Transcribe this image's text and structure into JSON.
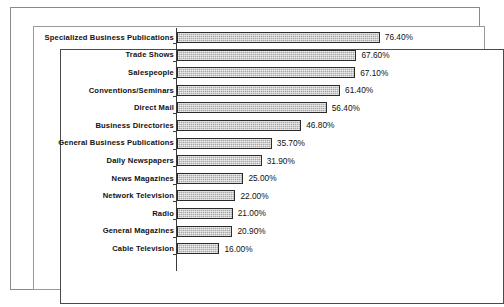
{
  "chart_data": {
    "type": "bar",
    "orientation": "horizontal",
    "title": "",
    "subtitle": "",
    "xlabel": "",
    "ylabel": "",
    "grid": false,
    "legend": false,
    "xlim": [
      0,
      80
    ],
    "value_suffix": "%",
    "categories": [
      "Specialized Business Publications",
      "Trade Shows",
      "Salespeople",
      "Conventions/Seminars",
      "Direct Mail",
      "Business Directories",
      "General Business Publications",
      "Daily Newspapers",
      "News Magazines",
      "Network Television",
      "Radio",
      "General Magazines",
      "Cable Television"
    ],
    "values": [
      76.4,
      67.6,
      67.1,
      61.4,
      56.4,
      46.8,
      35.7,
      31.9,
      25.0,
      22.0,
      21.0,
      20.9,
      16.0
    ],
    "value_labels": [
      "76.40%",
      "67.60%",
      "67.10%",
      "61.40%",
      "56.40%",
      "46.80%",
      "35.70%",
      "31.90%",
      "25.00%",
      "22.00%",
      "21.00%",
      "20.90%",
      "16.00%"
    ],
    "colors": {
      "bar_fill": "#a8a8a8",
      "bar_border": "#2b2b2b",
      "axis": "#3a3a3a",
      "text": "#111111",
      "background": "#ffffff",
      "frame_outer": "#8a8a8a",
      "frame_inner": "#4a4a4a"
    }
  }
}
